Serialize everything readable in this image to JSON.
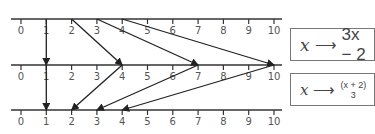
{
  "number_lines": [
    {
      "y": 19,
      "labels": [
        "0",
        "1",
        "2",
        "3",
        "4",
        "5",
        "6",
        "7",
        "8",
        "9",
        "10"
      ]
    },
    {
      "y": 65,
      "labels": [
        "0",
        "1",
        "2",
        "3",
        "4",
        "5",
        "6",
        "7",
        "8",
        "9",
        "10"
      ]
    },
    {
      "y": 110,
      "labels": [
        "0",
        "1",
        "2",
        "3",
        "4",
        "5",
        "6",
        "7",
        "8",
        "9",
        "10"
      ]
    }
  ],
  "mappings": {
    "forward": {
      "rule_var": "x",
      "rule_arrow": "⟶",
      "rule_expr": "3x − 2",
      "pairs": [
        [
          1,
          1
        ],
        [
          2,
          4
        ],
        [
          3,
          7
        ],
        [
          4,
          10
        ]
      ]
    },
    "inverse": {
      "rule_var": "x",
      "rule_arrow": "⟶",
      "rule_num": "(x + 2)",
      "rule_den": "3",
      "pairs": [
        [
          1,
          1
        ],
        [
          4,
          2
        ],
        [
          7,
          3
        ],
        [
          10,
          4
        ]
      ]
    }
  },
  "colors": {
    "line": "#333333",
    "text": "#555555",
    "box_border": "#777777"
  }
}
